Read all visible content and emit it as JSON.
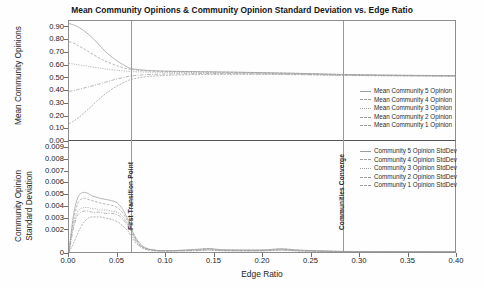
{
  "chart_data": {
    "type": "line",
    "title": "Mean Community Opinions & Community Opinion Standard Deviation vs. Edge Ratio",
    "xlabel": "Edge Ratio",
    "xlim": [
      0.0,
      0.4
    ],
    "xticks": [
      "0.00",
      "0.05",
      "0.10",
      "0.15",
      "0.20",
      "0.25",
      "0.30",
      "0.35",
      "0.40"
    ],
    "xtick_values": [
      0.0,
      0.05,
      0.1,
      0.15,
      0.2,
      0.25,
      0.3,
      0.35,
      0.4
    ],
    "grid": false,
    "legend_position": "right",
    "panels": [
      {
        "name": "mean-community-opinions",
        "ylabel": "Mean Community Opinions",
        "ylim": [
          0.0,
          0.95
        ],
        "yticks": [
          "0.00",
          "0.10",
          "0.20",
          "0.30",
          "0.40",
          "0.50",
          "0.60",
          "0.70",
          "0.80",
          "0.90"
        ],
        "ytick_values": [
          0.0,
          0.1,
          0.2,
          0.3,
          0.4,
          0.5,
          0.6,
          0.7,
          0.8,
          0.9
        ],
        "series": [
          {
            "name": "Mean Community 5 Opinion",
            "x": [
              0.0,
              0.005,
              0.01,
              0.015,
              0.02,
              0.025,
              0.03,
              0.035,
              0.04,
              0.05,
              0.06,
              0.065,
              0.08,
              0.1,
              0.13,
              0.16,
              0.2,
              0.24,
              0.28,
              0.32,
              0.36,
              0.4
            ],
            "values": [
              0.93,
              0.918,
              0.9,
              0.875,
              0.845,
              0.81,
              0.77,
              0.728,
              0.69,
              0.63,
              0.585,
              0.57,
              0.556,
              0.55,
              0.546,
              0.543,
              0.538,
              0.532,
              0.524,
              0.519,
              0.516,
              0.514
            ]
          },
          {
            "name": "Mean Community 4 Opinion",
            "x": [
              0.0,
              0.005,
              0.01,
              0.015,
              0.02,
              0.025,
              0.03,
              0.035,
              0.04,
              0.05,
              0.06,
              0.065,
              0.08,
              0.1,
              0.13,
              0.16,
              0.2,
              0.24,
              0.28,
              0.32,
              0.36,
              0.4
            ],
            "values": [
              0.785,
              0.772,
              0.752,
              0.73,
              0.706,
              0.683,
              0.66,
              0.64,
              0.622,
              0.592,
              0.57,
              0.562,
              0.552,
              0.548,
              0.545,
              0.542,
              0.537,
              0.531,
              0.523,
              0.518,
              0.515,
              0.513
            ]
          },
          {
            "name": "Mean Community 3 Opinion",
            "x": [
              0.0,
              0.005,
              0.01,
              0.015,
              0.02,
              0.025,
              0.03,
              0.035,
              0.04,
              0.05,
              0.06,
              0.065,
              0.08,
              0.1,
              0.13,
              0.16,
              0.2,
              0.24,
              0.28,
              0.32,
              0.36,
              0.4
            ],
            "values": [
              0.61,
              0.606,
              0.6,
              0.594,
              0.588,
              0.582,
              0.576,
              0.57,
              0.565,
              0.556,
              0.549,
              0.546,
              0.542,
              0.54,
              0.538,
              0.536,
              0.533,
              0.528,
              0.521,
              0.517,
              0.514,
              0.512
            ]
          },
          {
            "name": "Mean Community 2 Opinion",
            "x": [
              0.0,
              0.005,
              0.01,
              0.015,
              0.02,
              0.025,
              0.03,
              0.035,
              0.04,
              0.05,
              0.06,
              0.065,
              0.08,
              0.1,
              0.13,
              0.16,
              0.2,
              0.24,
              0.28,
              0.32,
              0.36,
              0.4
            ],
            "values": [
              0.388,
              0.395,
              0.404,
              0.414,
              0.424,
              0.434,
              0.444,
              0.456,
              0.466,
              0.488,
              0.505,
              0.512,
              0.522,
              0.527,
              0.53,
              0.53,
              0.528,
              0.524,
              0.518,
              0.515,
              0.512,
              0.51
            ]
          },
          {
            "name": "Mean Community 1 Opinion",
            "x": [
              0.0,
              0.005,
              0.01,
              0.015,
              0.02,
              0.025,
              0.03,
              0.035,
              0.04,
              0.05,
              0.06,
              0.065,
              0.08,
              0.1,
              0.13,
              0.16,
              0.2,
              0.24,
              0.28,
              0.32,
              0.36,
              0.4
            ],
            "values": [
              0.13,
              0.152,
              0.18,
              0.212,
              0.246,
              0.282,
              0.318,
              0.352,
              0.382,
              0.432,
              0.47,
              0.485,
              0.505,
              0.516,
              0.522,
              0.524,
              0.524,
              0.521,
              0.516,
              0.513,
              0.511,
              0.509
            ]
          }
        ]
      },
      {
        "name": "community-opinion-standard-deviation",
        "ylabel_line1": "Community Opinion",
        "ylabel_line2": "Standard Deviation",
        "ylim": [
          0.0,
          0.0095
        ],
        "yticks": [
          "0",
          "0.002",
          "0.003",
          "0.004",
          "0.005",
          "0.006",
          "0.007",
          "0.008",
          "0.009"
        ],
        "ytick_values": [
          0.0,
          0.002,
          0.003,
          0.004,
          0.005,
          0.006,
          0.007,
          0.008,
          0.009
        ],
        "series": [
          {
            "name": "Community 5 Opinion StdDev",
            "x": [
              0.0,
              0.004,
              0.008,
              0.012,
              0.016,
              0.02,
              0.024,
              0.028,
              0.032,
              0.038,
              0.044,
              0.05,
              0.056,
              0.062,
              0.068,
              0.075,
              0.085,
              0.1,
              0.13,
              0.145,
              0.16,
              0.2,
              0.22,
              0.24,
              0.28,
              0.32,
              0.4
            ],
            "values": [
              0.0,
              0.0028,
              0.0044,
              0.005,
              0.0051,
              0.005,
              0.0048,
              0.0047,
              0.0046,
              0.0045,
              0.0044,
              0.0042,
              0.0036,
              0.0026,
              0.0014,
              0.0006,
              0.0002,
              0.0001,
              0.00022,
              0.0003,
              0.0002,
              0.00018,
              0.00028,
              0.00016,
              6e-05,
              4e-05,
              3e-05
            ]
          },
          {
            "name": "Community 4 Opinion StdDev",
            "x": [
              0.0,
              0.004,
              0.008,
              0.012,
              0.016,
              0.02,
              0.024,
              0.028,
              0.032,
              0.038,
              0.044,
              0.05,
              0.056,
              0.062,
              0.068,
              0.075,
              0.085,
              0.1,
              0.13,
              0.145,
              0.16,
              0.2,
              0.22,
              0.24,
              0.28,
              0.32,
              0.4
            ],
            "values": [
              0.0,
              0.0024,
              0.0039,
              0.0045,
              0.0046,
              0.0045,
              0.0044,
              0.0043,
              0.0042,
              0.0041,
              0.004,
              0.0038,
              0.0033,
              0.0024,
              0.0013,
              0.0005,
              0.0002,
              0.0001,
              0.00018,
              0.00026,
              0.00017,
              0.00015,
              0.00024,
              0.00014,
              5e-05,
              3e-05,
              2e-05
            ]
          },
          {
            "name": "Community 3 Opinion StdDev",
            "x": [
              0.0,
              0.004,
              0.008,
              0.012,
              0.016,
              0.02,
              0.024,
              0.028,
              0.032,
              0.038,
              0.044,
              0.05,
              0.056,
              0.062,
              0.068,
              0.075,
              0.085,
              0.1,
              0.13,
              0.145,
              0.16,
              0.2,
              0.22,
              0.24,
              0.28,
              0.32,
              0.4
            ],
            "values": [
              0.0,
              0.002,
              0.0033,
              0.0037,
              0.0038,
              0.0038,
              0.0037,
              0.0037,
              0.0036,
              0.0036,
              0.0035,
              0.0034,
              0.003,
              0.0022,
              0.0012,
              0.0005,
              0.0002,
              0.0001,
              0.00015,
              0.00022,
              0.00014,
              0.00013,
              0.0002,
              0.00012,
              4e-05,
              3e-05,
              2e-05
            ]
          },
          {
            "name": "Community 2 Opinion StdDev",
            "x": [
              0.0,
              0.004,
              0.008,
              0.012,
              0.016,
              0.02,
              0.024,
              0.028,
              0.032,
              0.038,
              0.044,
              0.05,
              0.056,
              0.062,
              0.068,
              0.075,
              0.085,
              0.1,
              0.13,
              0.145,
              0.16,
              0.2,
              0.22,
              0.24,
              0.28,
              0.32,
              0.4
            ],
            "values": [
              0.0,
              0.0018,
              0.003,
              0.0034,
              0.0035,
              0.0035,
              0.0034,
              0.0034,
              0.0034,
              0.0033,
              0.0033,
              0.0032,
              0.0028,
              0.0021,
              0.0011,
              0.0004,
              0.0002,
              0.0001,
              0.00013,
              0.00019,
              0.00012,
              0.00011,
              0.00017,
              0.0001,
              4e-05,
              2e-05,
              2e-05
            ]
          },
          {
            "name": "Community 1 Opinion StdDev",
            "x": [
              0.0,
              0.004,
              0.008,
              0.012,
              0.016,
              0.02,
              0.024,
              0.028,
              0.032,
              0.038,
              0.044,
              0.05,
              0.056,
              0.062,
              0.068,
              0.075,
              0.085,
              0.1,
              0.13,
              0.145,
              0.16,
              0.2,
              0.22,
              0.24,
              0.28,
              0.32,
              0.4
            ],
            "values": [
              0.0,
              0.0006,
              0.0014,
              0.0021,
              0.0026,
              0.0029,
              0.003,
              0.003,
              0.003,
              0.0029,
              0.0028,
              0.0026,
              0.0022,
              0.0017,
              0.0009,
              0.0004,
              0.0001,
              0.0001,
              0.0001,
              0.00015,
              0.0001,
              9e-05,
              0.00014,
              8e-05,
              3e-05,
              2e-05,
              1e-05
            ]
          }
        ]
      }
    ],
    "annotations": [
      {
        "name": "first-transition-point",
        "label": "First Transition Point",
        "x": 0.065
      },
      {
        "name": "communities-converge",
        "label": "Communities Converge",
        "x": 0.283
      }
    ]
  },
  "colors": {
    "frame": "#8e8e8e",
    "series": "#9d9d9d",
    "annotation_line": "#9a9a9a",
    "text": "#1a1a1a",
    "background": "#ffffff"
  }
}
